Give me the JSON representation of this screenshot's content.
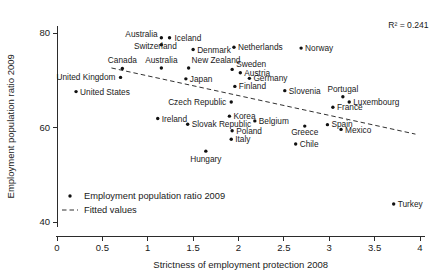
{
  "chart_data": {
    "type": "scatter",
    "title": "",
    "xlabel": "Strictness of employment protection 2008",
    "ylabel": "Employment population ratio 2009",
    "xlim": [
      0,
      4.05
    ],
    "ylim": [
      39.0,
      81.5
    ],
    "xticks": [
      "0",
      "0.5",
      "1",
      "1.5",
      "2",
      "2.5",
      "3",
      "3.5",
      "4"
    ],
    "xtick_values": [
      0,
      0.5,
      1,
      1.5,
      2,
      2.5,
      3,
      3.5,
      4
    ],
    "yticks": [
      "40",
      "60",
      "80"
    ],
    "ytick_values": [
      40,
      60,
      80
    ],
    "grid": false,
    "legend_position": "lower-left",
    "annotations": [
      {
        "name": "r-squared",
        "text": "R² = 0.241",
        "x": 3.65,
        "y": 81.0
      }
    ],
    "legend": [
      {
        "marker": "dot",
        "label": "Employment population ratio 2009"
      },
      {
        "marker": "dashed-line",
        "label": "Fitted values"
      }
    ],
    "series": [
      {
        "name": "Employment population ratio 2009",
        "marker": "dot",
        "points": [
          {
            "label": "Australia",
            "x": 1.15,
            "y": 77.5,
            "label_dx": -36,
            "label_dy": -8,
            "anchor": "start"
          },
          {
            "label": "Iceland",
            "x": 1.24,
            "y": 79.0,
            "label_dx": 5,
            "label_dy": 3,
            "anchor": "start"
          },
          {
            "label": "Switzerland",
            "x": 1.15,
            "y": 79.0,
            "label_dx": -6,
            "label_dy": 11,
            "anchor": "middle"
          },
          {
            "label": "Denmark",
            "x": 1.5,
            "y": 76.5,
            "label_dx": 4,
            "label_dy": 3,
            "anchor": "start"
          },
          {
            "label": "Netherlands",
            "x": 1.95,
            "y": 77.0,
            "label_dx": 4,
            "label_dy": 3,
            "anchor": "start"
          },
          {
            "label": "Norway",
            "x": 2.69,
            "y": 76.8,
            "label_dx": 4,
            "label_dy": 3,
            "anchor": "start"
          },
          {
            "label": "Canada",
            "x": 0.72,
            "y": 72.5,
            "label_dx": 0,
            "label_dy": -5,
            "anchor": "middle"
          },
          {
            "label": "Australia2",
            "display": "Australia",
            "x": 1.15,
            "y": 72.6,
            "label_dx": 0,
            "label_dy": -5,
            "anchor": "middle"
          },
          {
            "label": "New Zealand",
            "x": 1.45,
            "y": 72.6,
            "label_dx": 3,
            "label_dy": -5,
            "anchor": "start"
          },
          {
            "label": "Sweden",
            "x": 1.93,
            "y": 72.3,
            "label_dx": 4,
            "label_dy": -2,
            "anchor": "start"
          },
          {
            "label": "Austria",
            "x": 2.02,
            "y": 71.6,
            "label_dx": 4,
            "label_dy": 3,
            "anchor": "start"
          },
          {
            "label": "United Kingdom",
            "x": 0.7,
            "y": 70.6,
            "label_dx": -5,
            "label_dy": 3,
            "anchor": "end"
          },
          {
            "label": "Japan",
            "x": 1.42,
            "y": 70.3,
            "label_dx": 4,
            "label_dy": 3,
            "anchor": "start"
          },
          {
            "label": "Germany",
            "x": 2.12,
            "y": 70.4,
            "label_dx": 4,
            "label_dy": 3,
            "anchor": "start"
          },
          {
            "label": "United States",
            "x": 0.21,
            "y": 67.6,
            "label_dx": 4,
            "label_dy": 3,
            "anchor": "start"
          },
          {
            "label": "Finland",
            "x": 1.96,
            "y": 68.7,
            "label_dx": 4,
            "label_dy": 3,
            "anchor": "start"
          },
          {
            "label": "Slovenia",
            "x": 2.51,
            "y": 67.8,
            "label_dx": 4,
            "label_dy": 3,
            "anchor": "start"
          },
          {
            "label": "Portugal",
            "x": 3.15,
            "y": 66.5,
            "label_dx": 0,
            "label_dy": -5,
            "anchor": "middle"
          },
          {
            "label": "Luxembourg",
            "x": 3.22,
            "y": 65.4,
            "label_dx": 4,
            "label_dy": 3,
            "anchor": "start"
          },
          {
            "label": "Czech Republic",
            "x": 1.92,
            "y": 65.4,
            "label_dx": -5,
            "label_dy": 3,
            "anchor": "end"
          },
          {
            "label": "France",
            "x": 3.04,
            "y": 64.3,
            "label_dx": 4,
            "label_dy": 3,
            "anchor": "start"
          },
          {
            "label": "Ireland",
            "x": 1.11,
            "y": 61.9,
            "label_dx": 4,
            "label_dy": 3,
            "anchor": "start"
          },
          {
            "label": "Korea",
            "x": 1.9,
            "y": 62.4,
            "label_dx": 4,
            "label_dy": 3,
            "anchor": "start"
          },
          {
            "label": "Belgium",
            "x": 2.18,
            "y": 61.4,
            "label_dx": 4,
            "label_dy": 3,
            "anchor": "start"
          },
          {
            "label": "Slovak Republic",
            "x": 1.44,
            "y": 60.7,
            "label_dx": 4,
            "label_dy": 3,
            "anchor": "start"
          },
          {
            "label": "Spain",
            "x": 2.98,
            "y": 60.6,
            "label_dx": 4,
            "label_dy": 2,
            "anchor": "start"
          },
          {
            "label": "Greece",
            "x": 2.73,
            "y": 60.3,
            "label_dx": 0,
            "label_dy": 9,
            "anchor": "middle"
          },
          {
            "label": "Mexico",
            "x": 3.13,
            "y": 59.6,
            "label_dx": 4,
            "label_dy": 4,
            "anchor": "start"
          },
          {
            "label": "Poland",
            "x": 1.93,
            "y": 59.3,
            "label_dx": 4,
            "label_dy": 3,
            "anchor": "start"
          },
          {
            "label": "Italy",
            "x": 1.92,
            "y": 57.5,
            "label_dx": 4,
            "label_dy": 3,
            "anchor": "start"
          },
          {
            "label": "Chile",
            "x": 2.63,
            "y": 56.5,
            "label_dx": 4,
            "label_dy": 3,
            "anchor": "start"
          },
          {
            "label": "Hungary",
            "x": 1.64,
            "y": 55.0,
            "label_dx": 0,
            "label_dy": 11,
            "anchor": "middle"
          },
          {
            "label": "Turkey",
            "x": 3.71,
            "y": 43.8,
            "label_dx": 4,
            "label_dy": 3,
            "anchor": "start"
          }
        ]
      }
    ],
    "fit": {
      "name": "Fitted values",
      "style": "dashed",
      "x_start": 0.6,
      "y_start": 72.6,
      "x_end": 3.95,
      "y_end": 58.6
    }
  },
  "colors": {
    "axis": "#2b2b2b",
    "marker": "#111111",
    "text": "#1a1a1a",
    "background": "#ffffff"
  }
}
